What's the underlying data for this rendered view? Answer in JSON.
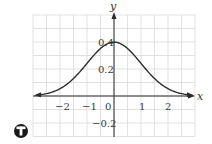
{
  "chart_data": {
    "type": "line",
    "title": "",
    "xlabel": "x",
    "ylabel": "y",
    "function": "standard normal density y = (1/sqrt(2π)) e^(-x²/2)",
    "xlim": [
      -3,
      3
    ],
    "ylim": [
      -0.3,
      0.6
    ],
    "grid": true,
    "x_ticks": [
      "-2",
      "-1",
      "0",
      "1",
      "2"
    ],
    "y_ticks": [
      "0.4",
      "0.2",
      "-0.2"
    ],
    "series": [
      {
        "name": "curve",
        "x": [
          -2.8,
          -2.5,
          -2,
          -1.5,
          -1,
          -0.5,
          0,
          0.5,
          1,
          1.5,
          2,
          2.5,
          2.8
        ],
        "y": [
          0.008,
          0.018,
          0.054,
          0.13,
          0.242,
          0.352,
          0.399,
          0.352,
          0.242,
          0.13,
          0.054,
          0.018,
          0.008
        ]
      }
    ],
    "annotations": [
      "technology icon (T)"
    ]
  },
  "labels": {
    "x_axis": "x",
    "y_axis": "y",
    "xt": [
      "−2",
      "−1",
      "0",
      "1",
      "2"
    ],
    "yt": [
      "0.4",
      "0.2",
      "−0.2"
    ],
    "icon_letter": "T"
  },
  "colors": {
    "grid": "#d9d9d9",
    "axis": "#2b2b2b",
    "curve": "#2b2b2b",
    "icon": "#1a1a1a"
  }
}
